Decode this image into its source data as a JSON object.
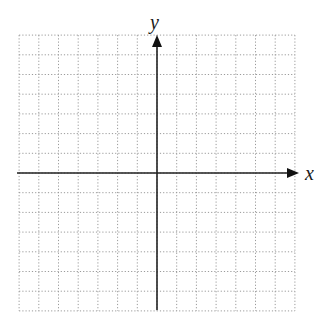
{
  "diagram": {
    "type": "coordinate-plane",
    "x_axis_label": "x",
    "y_axis_label": "y",
    "grid": {
      "columns": 14,
      "rows": 14,
      "cells_left_of_origin": 7,
      "cells_right_of_origin": 7,
      "cells_above_origin": 7,
      "cells_below_origin": 7,
      "line_style": "dotted",
      "line_color": "#9a9a9a"
    },
    "axes": {
      "color": "#222222",
      "x_arrow": "positive-direction",
      "y_arrow": "positive-direction"
    },
    "background": "#ffffff"
  }
}
